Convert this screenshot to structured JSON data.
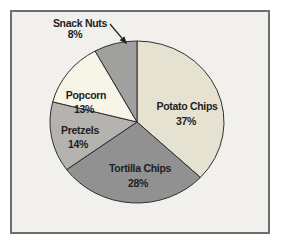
{
  "panel": {
    "background": "#f1f0ed",
    "border_color": "#6e6e6e"
  },
  "chart_data": {
    "type": "pie",
    "title": "",
    "direction": "clockwise",
    "start_angle_deg": 0,
    "legend": "none",
    "stroke_color": "#2f2f2f",
    "text_color": "#1e1e1e",
    "center": {
      "x": 137,
      "y": 122
    },
    "radius_x": 87,
    "radius_y": 81,
    "slices": [
      {
        "label": "Potato Chips",
        "pct": 37,
        "color": "#e6e2d2",
        "label_x": 187,
        "label_y": 110,
        "pct_x": 186,
        "pct_y": 125
      },
      {
        "label": "Tortilla Chips",
        "pct": 28,
        "color": "#919191",
        "label_x": 140,
        "label_y": 172,
        "pct_x": 138,
        "pct_y": 187
      },
      {
        "label": "Pretzels",
        "pct": 14,
        "color": "#b4b3af",
        "label_x": 80,
        "label_y": 134,
        "pct_x": 78,
        "pct_y": 148
      },
      {
        "label": "Popcorn",
        "pct": 13,
        "color": "#f7f5e8",
        "label_x": 86,
        "label_y": 99,
        "pct_x": 84,
        "pct_y": 113
      },
      {
        "label": "Snack Nuts",
        "pct": 8,
        "color": "#a0a09e",
        "label_x": 80,
        "label_y": 27,
        "pct_x": 75,
        "pct_y": 38
      }
    ],
    "callout": {
      "for": "Snack Nuts",
      "x1": 110,
      "y1": 24,
      "x2": 126,
      "y2": 43,
      "color": "#222222"
    }
  }
}
